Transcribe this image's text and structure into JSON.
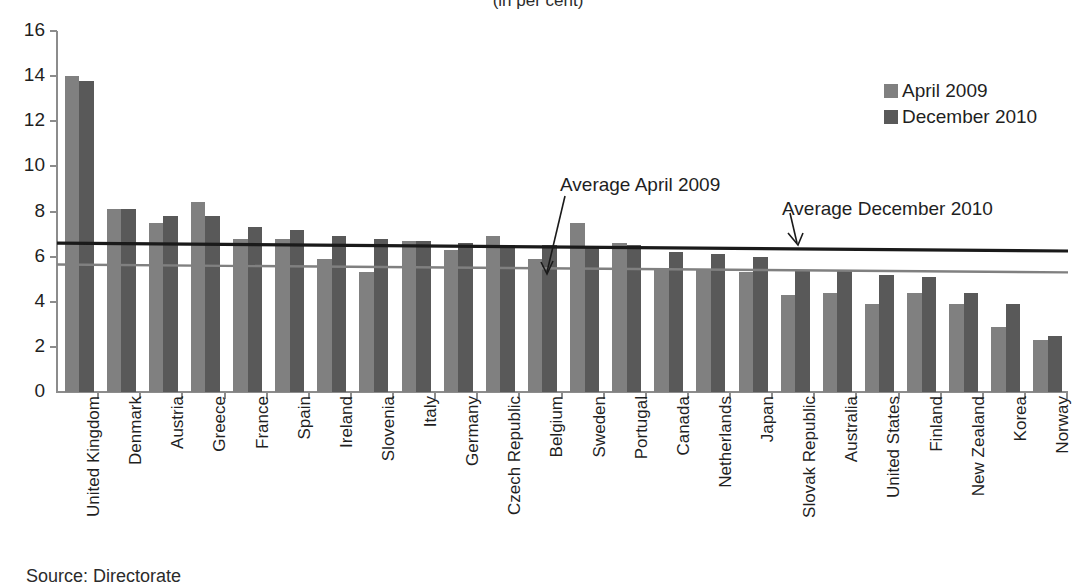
{
  "title_clipped": "(in per cent)",
  "source_note_clipped": "Source:  Directorate",
  "colors": {
    "series_april": "#808080",
    "series_december": "#595959",
    "avg_april_line": "#808080",
    "avg_december_line": "#1a1a1a",
    "axis": "#8c8c8c",
    "text": "#1f1f1f"
  },
  "legend": {
    "position": "top-right",
    "items": [
      {
        "label": "April 2009",
        "color": "#808080",
        "swatch": "legend-swatch-april"
      },
      {
        "label": "December 2010",
        "color": "#595959",
        "swatch": "legend-swatch-december"
      }
    ]
  },
  "annotations": [
    {
      "id": "annot-april",
      "text": "Average April 2009"
    },
    {
      "id": "annot-december",
      "text": "Average December 2010"
    }
  ],
  "chart_data": {
    "type": "bar",
    "title": "(in per cent)",
    "xlabel": "",
    "ylabel": "",
    "ylim": [
      0,
      16
    ],
    "yticks": [
      0,
      2,
      4,
      6,
      8,
      10,
      12,
      14,
      16
    ],
    "grid": false,
    "legend_position": "top-right",
    "categories": [
      "United Kingdom",
      "Denmark",
      "Austria",
      "Greece",
      "France",
      "Spain",
      "Ireland",
      "Slovenia",
      "Italy",
      "Germany",
      "Czech Republic",
      "Belgium",
      "Sweden",
      "Portugal",
      "Canada",
      "Netherlands",
      "Japan",
      "Slovak Republic",
      "Australia",
      "United States",
      "Finland",
      "New Zealand",
      "Korea",
      "Norway"
    ],
    "series": [
      {
        "name": "April 2009",
        "color": "#808080",
        "values": [
          14.0,
          8.1,
          7.5,
          8.4,
          6.8,
          6.8,
          5.9,
          5.3,
          6.7,
          6.3,
          6.9,
          5.9,
          7.5,
          6.6,
          5.5,
          5.4,
          5.3,
          4.3,
          4.4,
          3.9,
          4.4,
          3.9,
          2.9,
          2.3
        ]
      },
      {
        "name": "December 2010",
        "color": "#595959",
        "values": [
          13.8,
          8.1,
          7.8,
          7.8,
          7.3,
          7.2,
          6.9,
          6.8,
          6.7,
          6.6,
          6.5,
          6.5,
          6.4,
          6.5,
          6.2,
          6.1,
          6.0,
          5.4,
          5.4,
          5.2,
          5.1,
          4.4,
          3.9,
          2.5
        ]
      }
    ],
    "reference_lines": [
      {
        "name": "Average April 2009",
        "color": "#808080",
        "y_start": 5.65,
        "y_end": 5.3
      },
      {
        "name": "Average December 2010",
        "color": "#1a1a1a",
        "y_start": 6.6,
        "y_end": 6.25
      }
    ]
  }
}
